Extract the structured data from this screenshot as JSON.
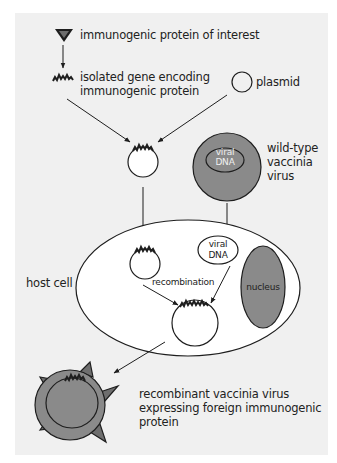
{
  "colors": {
    "background": "#ffffff",
    "panel": "#f0f0f0",
    "outline": "#1e1e1e",
    "virus_fill": "#8a8a8a",
    "protein_fill": "#6e6e6e",
    "cell_fill": "#ffffff",
    "text": "#222222"
  },
  "labels": {
    "protein": "immunogenic protein of interest",
    "gene_line1": "isolated gene encoding",
    "gene_line2": "immunogenic protein",
    "plasmid": "plasmid",
    "wildtype_line1": "wild-type",
    "wildtype_line2": "vaccinia",
    "wildtype_line3": "virus",
    "viral_dna_outer_line1": "viral",
    "viral_dna_outer_line2": "DNA",
    "viral_dna_inner_line1": "viral",
    "viral_dna_inner_line2": "DNA",
    "host_cell": "host cell",
    "recombination": "recombination",
    "nucleus": "nucleus",
    "result_line1": "recombinant vaccinia virus",
    "result_line2": "expressing foreign immunogenic",
    "result_line3": "protein"
  },
  "icons": {
    "protein": "inverted-triangle-icon",
    "gene": "zigzag-gene-icon",
    "plasmid": "circle-icon",
    "arrow": "arrow-icon"
  }
}
